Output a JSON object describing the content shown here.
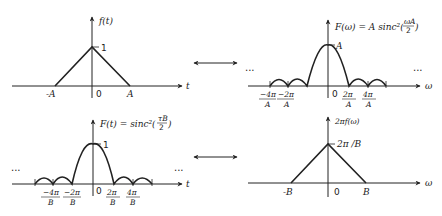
{
  "panels": {
    "top_left": {
      "y_label": "f(t)",
      "x_label": "t",
      "peak_label": "1",
      "ticks": [
        "-A",
        "0",
        "A"
      ]
    },
    "top_right": {
      "y_label": "F(ω) = A sinc²(ωA/2)",
      "y_label_main": "F(ω) = A sinc²(",
      "frac_num": "ωA",
      "frac_den": "2",
      "y_label_close": ")",
      "x_label": "ω",
      "peak_label": "A",
      "zero": "0",
      "ticks": [
        {
          "num": "−4π",
          "den": "A"
        },
        {
          "num": "−2π",
          "den": "A"
        },
        {
          "num": "2π",
          "den": "A"
        },
        {
          "num": "4π",
          "den": "A"
        }
      ],
      "ellipsis": "..."
    },
    "bottom_left": {
      "y_label": "F(t) = sinc²(τB/2)",
      "y_label_main": "F(t) = sinc²(",
      "frac_num": "τB",
      "frac_den": "2",
      "y_label_close": ")",
      "x_label": "t",
      "peak_label": "1",
      "zero": "0",
      "ticks": [
        {
          "num": "−4π",
          "den": "B"
        },
        {
          "num": "−2π",
          "den": "B"
        },
        {
          "num": "2π",
          "den": "B"
        },
        {
          "num": "4π",
          "den": "B"
        }
      ],
      "ellipsis": "..."
    },
    "bottom_right": {
      "y_label": "2πf(ω)",
      "x_label": "ω",
      "peak_label": "2π /B",
      "ticks": [
        "-B",
        "0",
        "B"
      ]
    }
  },
  "arrows": [
    {
      "label": "double-arrow-top"
    },
    {
      "label": "double-arrow-bottom"
    }
  ]
}
